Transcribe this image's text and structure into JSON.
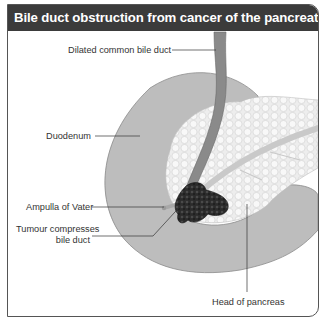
{
  "figure": {
    "title": "Bile duct obstruction from cancer of the pancreatic head",
    "labels": {
      "dilated_cbd": "Dilated common bile duct",
      "duodenum": "Duodenum",
      "ampulla": "Ampulla of Vater",
      "tumour_line1": "Tumour compresses",
      "tumour_line2": "bile duct",
      "head_pancreas": "Head of pancreas"
    },
    "colors": {
      "title_bar": "#3b3b3b",
      "duodenum": "#bdbdbd",
      "bile_duct": "#8a8a8a",
      "pancreas": "#ececec",
      "tumour": "#2a2a2a",
      "border": "#555555"
    }
  }
}
